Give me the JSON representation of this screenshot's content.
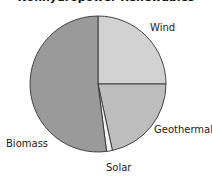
{
  "chart_data": {
    "type": "pie",
    "title": "Nonhydropower Renewables",
    "start_angle": "12 o'clock, clockwise",
    "categories": [
      "Wind",
      "Geothermal",
      "Solar",
      "Biomass"
    ],
    "values": [
      25,
      21.6,
      1.4,
      52
    ],
    "units": "percent (estimated)",
    "colors": {
      "Wind": "#d2d2d2",
      "Geothermal": "#bdbdbd",
      "Solar": "#f2f2f2",
      "Biomass": "#9a9a9a"
    },
    "edge_color": "#333333",
    "legend": "none (direct labels)"
  },
  "labels": {
    "wind": "Wind",
    "geothermal": "Geothermal",
    "solar": "Solar",
    "biomass": "Biomass"
  }
}
